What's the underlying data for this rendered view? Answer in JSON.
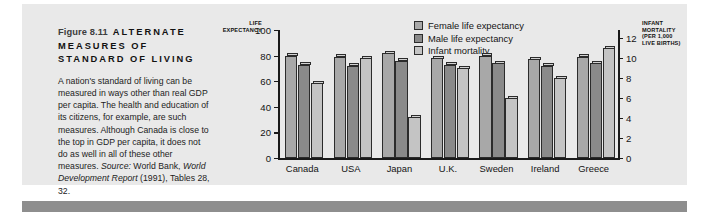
{
  "figure": {
    "number": "Figure 8.11",
    "title": "ALTERNATE MEASURES OF STANDARD OF LIVING",
    "caption_part1": "A nation's standard of living can be measured in ways other than real GDP per capita. The health and education of its citizens, for example, are such measures. Although Canada is close to the top in GDP per capita, it does not do as well in all of these other measures. ",
    "caption_source_label": "Source:",
    "caption_part2": " World Bank, ",
    "caption_source_italic": "World Development Report",
    "caption_part3": " (1991), Tables 28, 32."
  },
  "chart_data": {
    "type": "bar",
    "title": "",
    "categories": [
      "Canada",
      "USA",
      "Japan",
      "U.K.",
      "Sweden",
      "Ireland",
      "Greece"
    ],
    "series": [
      {
        "name": "Female life expectancy",
        "axis": "left",
        "color": "#a8a8a8",
        "values": [
          80,
          79,
          82,
          78,
          80,
          77,
          79
        ]
      },
      {
        "name": "Male life expectancy",
        "axis": "left",
        "color": "#8a8a8a",
        "values": [
          73,
          72,
          76,
          73,
          74,
          72,
          74
        ]
      },
      {
        "name": "Infant mortality",
        "axis": "right",
        "color": "#c4c4c4",
        "values": [
          7.5,
          10.0,
          4.1,
          9.0,
          6.0,
          8.0,
          11.0
        ]
      }
    ],
    "left_axis": {
      "label": "LIFE EXPECTANCY",
      "ticks": [
        0,
        20,
        40,
        60,
        80,
        100
      ],
      "min": 0,
      "max": 100
    },
    "right_axis": {
      "label": "INFANT MORTALITY (PER 1,000 LIVE BIRTHS)",
      "label_line1": "INFANT",
      "label_line2": "MORTALITY",
      "label_line3": "(PER 1,000",
      "label_line4": "LIVE BIRTHS)",
      "ticks": [
        0,
        2,
        4,
        6,
        8,
        10,
        12
      ],
      "min": 0,
      "max": 12.8
    },
    "legend": {
      "position": "top-right",
      "entries": [
        "Female life expectancy",
        "Male life expectancy",
        "Infant mortality"
      ]
    },
    "grid": false
  }
}
